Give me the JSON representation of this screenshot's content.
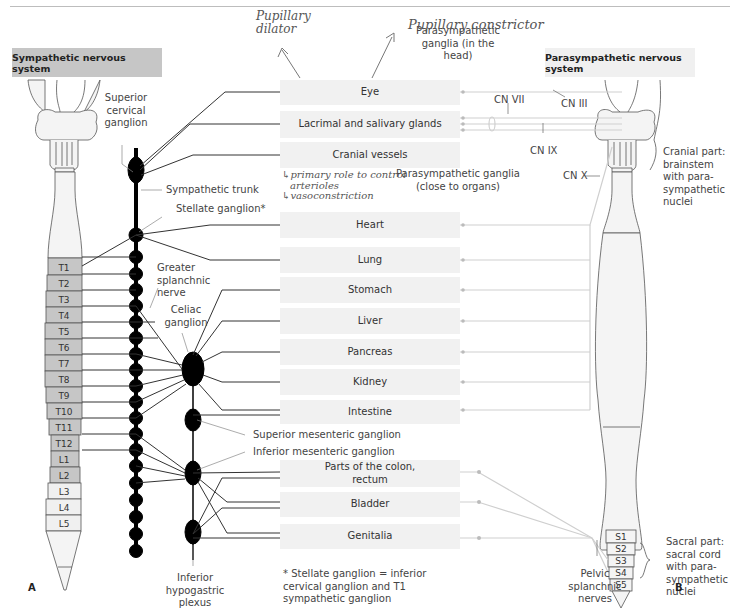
{
  "headers": {
    "sympathetic": "Sympathetic nervous system",
    "parasympathetic": "Parasympathetic nervous system"
  },
  "handwritten": {
    "pupillary_dilator": [
      "Pupillary",
      "dilator"
    ],
    "pupillary_constrictor": "Pupillary constrictor",
    "cranial_vessels_note": [
      "↳primary role to control",
      "arterioles",
      "↳vasoconstriction"
    ]
  },
  "organs": [
    {
      "label": "Eye"
    },
    {
      "label": "Lacrimal and salivary glands"
    },
    {
      "label": "Cranial vessels"
    },
    {
      "label": "Heart"
    },
    {
      "label": "Lung"
    },
    {
      "label": "Stomach"
    },
    {
      "label": "Liver"
    },
    {
      "label": "Pancreas"
    },
    {
      "label": "Kidney"
    },
    {
      "label": "Intestine"
    },
    {
      "label": "Parts of the colon, rectum"
    },
    {
      "label": "Bladder"
    },
    {
      "label": "Genitalia"
    }
  ],
  "sympathetic_labels": {
    "superior_cervical_ganglion": "Superior cervical ganglion",
    "sympathetic_trunk": "Sympathetic trunk",
    "stellate_ganglion": "Stellate ganglion*",
    "greater_splanchnic_nerve": "Greater splanchnic nerve",
    "celiac_ganglion": "Celiac ganglion",
    "superior_mesenteric_ganglion": "Superior mesenteric ganglion",
    "inferior_mesenteric_ganglion": "Inferior mesenteric ganglion",
    "inferior_hypogastric_plexus": "Inferior hypogastric plexus"
  },
  "parasympathetic_labels": {
    "ganglia_head": "Parasympathetic ganglia (in the head)",
    "ganglia_organs": "Parasympathetic ganglia (close to organs)",
    "cn_iii": "CN III",
    "cn_vii": "CN VII",
    "cn_ix": "CN IX",
    "cn_x": "CN X",
    "cranial_part": "Cranial part: brainstem with para-sympathetic nuclei",
    "sacral_part": "Sacral part: sacral cord with para-sympathetic nuclei",
    "pelvic_splanchnic": "Pelvic splanchnic nerves"
  },
  "footnote": "* Stellate ganglion = inferior cervical ganglion and T1 sympathetic ganglion",
  "spinal_segments": {
    "thoracic": [
      "T1",
      "T2",
      "T3",
      "T4",
      "T5",
      "T6",
      "T7",
      "T8",
      "T9",
      "T10",
      "T11",
      "T12"
    ],
    "lumbar": [
      "L1",
      "L2",
      "L3",
      "L4",
      "L5"
    ],
    "sacral": [
      "S1",
      "S2",
      "S3",
      "S4",
      "S5"
    ]
  },
  "panel_letters": {
    "left": "A",
    "right": "B"
  },
  "colors": {
    "sympathetic_segment": "#c6c6c6",
    "organ_box": "#f1f1f1",
    "ganglion": "#000000",
    "para_line": "#cfcfcf"
  }
}
